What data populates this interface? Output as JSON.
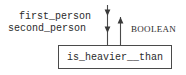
{
  "diagram": {
    "type": "function-signature-dataflow",
    "function_box": {
      "name": "is_heavier__than"
    },
    "inputs": [
      {
        "label": "first_person",
        "direction": "down"
      },
      {
        "label": "second_person",
        "direction": "down"
      }
    ],
    "output": {
      "label": "BOOLEAN",
      "direction": "up"
    },
    "colors": {
      "stroke": "#4a4a4a",
      "text": "#2b2b2b",
      "background": "#ffffff"
    }
  }
}
